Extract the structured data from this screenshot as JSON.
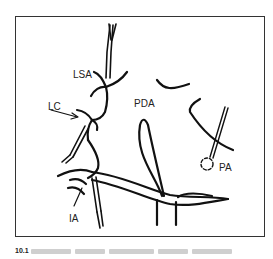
{
  "figure": {
    "labels": {
      "lsa": "LSA",
      "lc": "LC",
      "pda": "PDA",
      "pa": "PA",
      "ia": "IA"
    },
    "caption": {
      "number": "10.1",
      "text": ""
    },
    "colors": {
      "line": "#111111",
      "frame": "#333333",
      "caption_number": "#222222"
    }
  }
}
